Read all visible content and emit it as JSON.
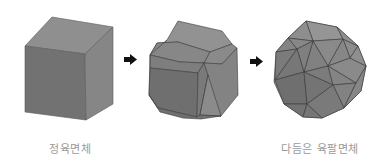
{
  "figure": {
    "stages": [
      {
        "id": "cube",
        "label": "정육면체"
      },
      {
        "id": "intermediate",
        "label": ""
      },
      {
        "id": "snub-cuboctahedron",
        "label": "다듬은 육팔면체"
      }
    ],
    "arrows": [
      {
        "from": "cube",
        "to": "intermediate",
        "glyph": "arrow-right"
      },
      {
        "from": "intermediate",
        "to": "snub-cuboctahedron",
        "glyph": "arrow-right"
      }
    ],
    "colors": {
      "face_light": "#8e8e8e",
      "face_mid": "#7d7d7d",
      "face_dark": "#6f6f6f",
      "edge": "#3a3a3a",
      "arrow": "#111111",
      "label": "#9a9a9a"
    }
  }
}
